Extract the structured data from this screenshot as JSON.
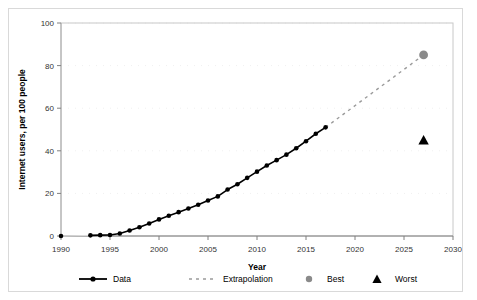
{
  "chart_data": {
    "type": "line",
    "title": "",
    "xlabel": "Year",
    "ylabel": "Internet users, per 100 people",
    "xlim": [
      1990,
      2030
    ],
    "ylim": [
      0,
      100
    ],
    "xticks": [
      1990,
      1995,
      2000,
      2005,
      2010,
      2015,
      2020,
      2025,
      2030
    ],
    "yticks": [
      0,
      20,
      40,
      60,
      80,
      100
    ],
    "grid": "faint-horizontal",
    "legend_position": "bottom",
    "legend": [
      {
        "label": "Data",
        "style": "solid-line-with-round-marker",
        "color": "#000000"
      },
      {
        "label": "Extrapolation",
        "style": "dashed-line",
        "color": "#9a9a9a"
      },
      {
        "label": "Best",
        "style": "circle-marker",
        "color": "#8a8a8a"
      },
      {
        "label": "Worst",
        "style": "triangle-marker",
        "color": "#000000"
      }
    ],
    "series": [
      {
        "name": "Data",
        "style": "solid-line-with-round-marker",
        "color": "#000000",
        "x": [
          1990,
          1993,
          1994,
          1995,
          1996,
          1997,
          1998,
          1999,
          2000,
          2001,
          2002,
          2003,
          2004,
          2005,
          2006,
          2007,
          2008,
          2009,
          2010,
          2011,
          2012,
          2013,
          2014,
          2015,
          2016,
          2017
        ],
        "values": [
          0,
          0.3,
          0.4,
          0.5,
          1.2,
          2.6,
          4.1,
          5.9,
          7.8,
          9.5,
          11.2,
          12.9,
          14.7,
          16.7,
          18.6,
          21.8,
          24.3,
          27.3,
          30.2,
          33.1,
          35.6,
          38.2,
          41.2,
          44.5,
          48.0,
          51.0
        ]
      },
      {
        "name": "Extrapolation",
        "style": "dashed-line",
        "color": "#9a9a9a",
        "x": [
          2017,
          2027
        ],
        "values": [
          51.0,
          85.0
        ]
      },
      {
        "name": "Best",
        "style": "circle-marker",
        "color": "#8a8a8a",
        "x": [
          2027
        ],
        "values": [
          85.0
        ]
      },
      {
        "name": "Worst",
        "style": "triangle-marker",
        "color": "#000000",
        "x": [
          2027
        ],
        "values": [
          45.0
        ]
      }
    ]
  }
}
